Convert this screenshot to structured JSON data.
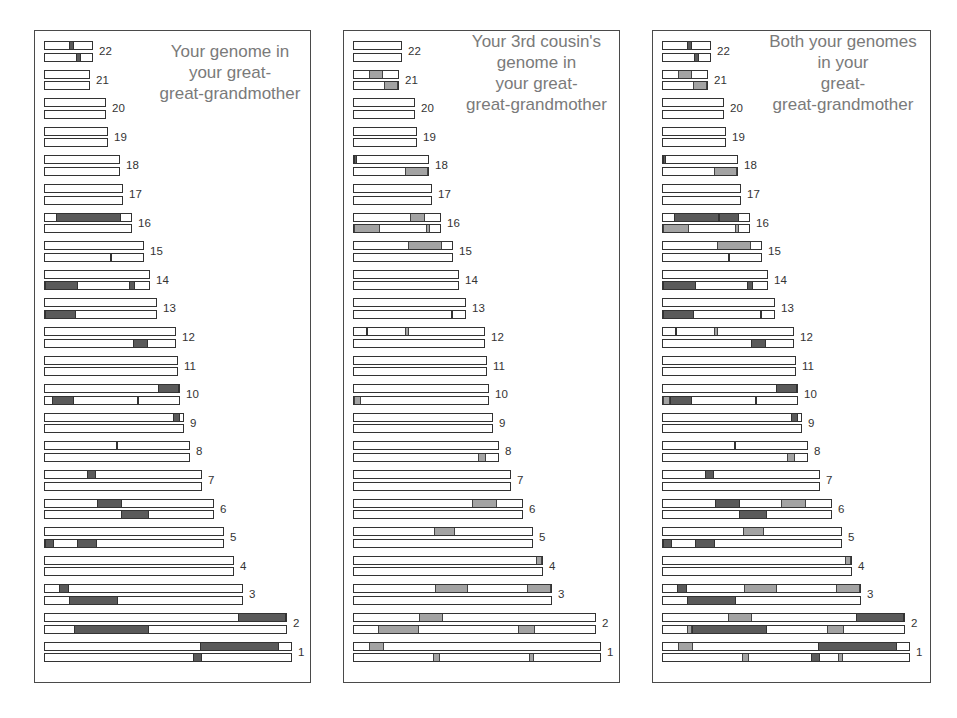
{
  "colors": {
    "you_segment": "#5a5a5a",
    "cousin_segment": "#a3a3a3",
    "bar_fill": "#ffffff",
    "bar_border": "#333333",
    "title_text": "#7a7a7a"
  },
  "chromosome_lengths_px": {
    "22": 49,
    "21": 46,
    "20": 62,
    "19": 64,
    "18": 76,
    "17": 79,
    "16": 88,
    "15": 100,
    "14": 106,
    "13": 113,
    "12": 132,
    "11": 134,
    "10": 136,
    "9": 140,
    "8": 146,
    "7": 158,
    "6": 170,
    "5": 180,
    "4": 190,
    "3": 199,
    "2": 243,
    "1": 248
  },
  "panels": [
    {
      "id": "you",
      "title_lines": [
        "Your genome in",
        "your great-",
        "great-grandmother"
      ],
      "chromosomes": [
        {
          "label": "22",
          "top": [
            [
              0.52,
              0.62,
              "dark"
            ]
          ],
          "bottom": [
            [
              0.66,
              0.76,
              "dark"
            ]
          ]
        },
        {
          "label": "21",
          "top": [],
          "bottom": []
        },
        {
          "label": "20",
          "top": [],
          "bottom": []
        },
        {
          "label": "19",
          "top": [],
          "bottom": []
        },
        {
          "label": "18",
          "top": [],
          "bottom": []
        },
        {
          "label": "17",
          "top": [],
          "bottom": []
        },
        {
          "label": "16",
          "top": [
            [
              0.13,
              0.88,
              "dark"
            ]
          ],
          "bottom": []
        },
        {
          "label": "15",
          "top": [],
          "bottom": [
            [
              0.66,
              0.69,
              "tick"
            ]
          ]
        },
        {
          "label": "14",
          "top": [],
          "bottom": [
            [
              0.0,
              0.32,
              "dark"
            ],
            [
              0.81,
              0.87,
              "dark"
            ]
          ]
        },
        {
          "label": "13",
          "top": [],
          "bottom": [
            [
              0.0,
              0.28,
              "dark"
            ]
          ]
        },
        {
          "label": "12",
          "top": [],
          "bottom": [
            [
              0.68,
              0.79,
              "dark"
            ]
          ]
        },
        {
          "label": "11",
          "top": [],
          "bottom": []
        },
        {
          "label": "10",
          "top": [
            [
              0.84,
              1.0,
              "dark"
            ]
          ],
          "bottom": [
            [
              0.05,
              0.22,
              "dark"
            ],
            [
              0.69,
              0.71,
              "tick"
            ]
          ]
        },
        {
          "label": "9",
          "top": [
            [
              0.93,
              0.98,
              "dark"
            ]
          ],
          "bottom": []
        },
        {
          "label": "8",
          "top": [
            [
              0.49,
              0.51,
              "tick"
            ]
          ],
          "bottom": []
        },
        {
          "label": "7",
          "top": [
            [
              0.27,
              0.33,
              "dark"
            ]
          ],
          "bottom": []
        },
        {
          "label": "6",
          "top": [
            [
              0.31,
              0.46,
              "dark"
            ]
          ],
          "bottom": [
            [
              0.45,
              0.62,
              "dark"
            ]
          ]
        },
        {
          "label": "5",
          "top": [],
          "bottom": [
            [
              0.0,
              0.05,
              "dark"
            ],
            [
              0.18,
              0.29,
              "dark"
            ]
          ]
        },
        {
          "label": "4",
          "top": [],
          "bottom": []
        },
        {
          "label": "3",
          "top": [
            [
              0.07,
              0.12,
              "dark"
            ]
          ],
          "bottom": [
            [
              0.12,
              0.37,
              "dark"
            ]
          ]
        },
        {
          "label": "2",
          "top": [
            [
              0.8,
              1.0,
              "dark"
            ]
          ],
          "bottom": [
            [
              0.12,
              0.43,
              "dark"
            ]
          ]
        },
        {
          "label": "1",
          "top": [
            [
              0.63,
              0.95,
              "dark"
            ]
          ],
          "bottom": [
            [
              0.6,
              0.64,
              "dark"
            ]
          ]
        }
      ]
    },
    {
      "id": "cousin",
      "title_lines": [
        "Your 3rd cousin's",
        "genome in",
        "your great-",
        "great-grandmother"
      ],
      "chromosomes": [
        {
          "label": "22",
          "top": [],
          "bottom": []
        },
        {
          "label": "21",
          "top": [
            [
              0.33,
              0.66,
              "light"
            ]
          ],
          "bottom": [
            [
              0.68,
              1.0,
              "light"
            ]
          ]
        },
        {
          "label": "20",
          "top": [],
          "bottom": []
        },
        {
          "label": "19",
          "top": [],
          "bottom": []
        },
        {
          "label": "18",
          "top": [
            [
              0.0,
              0.04,
              "dark"
            ]
          ],
          "bottom": [
            [
              0.69,
              1.0,
              "light"
            ]
          ]
        },
        {
          "label": "17",
          "top": [],
          "bottom": []
        },
        {
          "label": "16",
          "top": [
            [
              0.65,
              0.83,
              "light"
            ]
          ],
          "bottom": [
            [
              0.0,
              0.3,
              "light"
            ],
            [
              0.84,
              0.88,
              "light"
            ]
          ]
        },
        {
          "label": "15",
          "top": [
            [
              0.55,
              0.9,
              "light"
            ]
          ],
          "bottom": []
        },
        {
          "label": "14",
          "top": [],
          "bottom": []
        },
        {
          "label": "13",
          "top": [],
          "bottom": [
            [
              0.87,
              0.89,
              "tick"
            ]
          ]
        },
        {
          "label": "12",
          "top": [
            [
              0.09,
              0.11,
              "tick"
            ],
            [
              0.39,
              0.42,
              "light"
            ]
          ],
          "bottom": []
        },
        {
          "label": "11",
          "top": [],
          "bottom": []
        },
        {
          "label": "10",
          "top": [],
          "bottom": [
            [
              0.0,
              0.05,
              "light"
            ]
          ]
        },
        {
          "label": "9",
          "top": [],
          "bottom": []
        },
        {
          "label": "8",
          "top": [],
          "bottom": [
            [
              0.86,
              0.92,
              "light"
            ]
          ]
        },
        {
          "label": "7",
          "top": [],
          "bottom": []
        },
        {
          "label": "6",
          "top": [
            [
              0.7,
              0.85,
              "light"
            ]
          ],
          "bottom": []
        },
        {
          "label": "5",
          "top": [
            [
              0.45,
              0.57,
              "light"
            ]
          ],
          "bottom": []
        },
        {
          "label": "4",
          "top": [
            [
              0.97,
              1.0,
              "light"
            ]
          ],
          "bottom": []
        },
        {
          "label": "3",
          "top": [
            [
              0.41,
              0.58,
              "light"
            ],
            [
              0.88,
              1.0,
              "light"
            ]
          ],
          "bottom": []
        },
        {
          "label": "2",
          "top": [
            [
              0.27,
              0.37,
              "light"
            ]
          ],
          "bottom": [
            [
              0.1,
              0.27,
              "light"
            ],
            [
              0.68,
              0.75,
              "light"
            ]
          ]
        },
        {
          "label": "1",
          "top": [
            [
              0.06,
              0.12,
              "light"
            ]
          ],
          "bottom": [
            [
              0.32,
              0.35,
              "light"
            ],
            [
              0.71,
              0.73,
              "light"
            ]
          ]
        }
      ]
    },
    {
      "id": "both",
      "title_lines": [
        "Both your genomes",
        "in your",
        "great-",
        "great-grandmother"
      ],
      "chromosomes": [
        {
          "label": "22",
          "top": [
            [
              0.52,
              0.62,
              "dark"
            ]
          ],
          "bottom": [
            [
              0.66,
              0.76,
              "dark"
            ]
          ]
        },
        {
          "label": "21",
          "top": [
            [
              0.33,
              0.66,
              "light"
            ]
          ],
          "bottom": [
            [
              0.68,
              1.0,
              "light"
            ]
          ]
        },
        {
          "label": "20",
          "top": [],
          "bottom": []
        },
        {
          "label": "19",
          "top": [],
          "bottom": []
        },
        {
          "label": "18",
          "top": [
            [
              0.0,
              0.04,
              "dark"
            ]
          ],
          "bottom": [
            [
              0.69,
              1.0,
              "light"
            ]
          ]
        },
        {
          "label": "17",
          "top": [],
          "bottom": []
        },
        {
          "label": "16",
          "top": [
            [
              0.13,
              0.65,
              "dark"
            ],
            [
              0.65,
              0.88,
              "dark"
            ]
          ],
          "bottom": [
            [
              0.0,
              0.3,
              "light"
            ],
            [
              0.84,
              0.88,
              "light"
            ]
          ]
        },
        {
          "label": "15",
          "top": [
            [
              0.55,
              0.9,
              "light"
            ]
          ],
          "bottom": [
            [
              0.66,
              0.69,
              "tick"
            ]
          ]
        },
        {
          "label": "14",
          "top": [],
          "bottom": [
            [
              0.0,
              0.32,
              "dark"
            ],
            [
              0.81,
              0.87,
              "dark"
            ]
          ]
        },
        {
          "label": "13",
          "top": [],
          "bottom": [
            [
              0.0,
              0.28,
              "dark"
            ],
            [
              0.87,
              0.89,
              "tick"
            ]
          ]
        },
        {
          "label": "12",
          "top": [
            [
              0.09,
              0.11,
              "tick"
            ],
            [
              0.39,
              0.42,
              "light"
            ]
          ],
          "bottom": [
            [
              0.68,
              0.79,
              "dark"
            ]
          ]
        },
        {
          "label": "11",
          "top": [],
          "bottom": []
        },
        {
          "label": "10",
          "top": [
            [
              0.84,
              1.0,
              "dark"
            ]
          ],
          "bottom": [
            [
              0.0,
              0.05,
              "light"
            ],
            [
              0.05,
              0.22,
              "dark"
            ],
            [
              0.69,
              0.71,
              "tick"
            ]
          ]
        },
        {
          "label": "9",
          "top": [
            [
              0.93,
              0.98,
              "dark"
            ]
          ],
          "bottom": []
        },
        {
          "label": "8",
          "top": [
            [
              0.49,
              0.51,
              "tick"
            ]
          ],
          "bottom": [
            [
              0.86,
              0.92,
              "light"
            ]
          ]
        },
        {
          "label": "7",
          "top": [
            [
              0.27,
              0.33,
              "dark"
            ]
          ],
          "bottom": []
        },
        {
          "label": "6",
          "top": [
            [
              0.31,
              0.46,
              "dark"
            ],
            [
              0.7,
              0.85,
              "light"
            ]
          ],
          "bottom": [
            [
              0.45,
              0.62,
              "dark"
            ]
          ]
        },
        {
          "label": "5",
          "top": [
            [
              0.45,
              0.57,
              "light"
            ]
          ],
          "bottom": [
            [
              0.0,
              0.05,
              "dark"
            ],
            [
              0.18,
              0.29,
              "dark"
            ]
          ]
        },
        {
          "label": "4",
          "top": [
            [
              0.97,
              1.0,
              "light"
            ]
          ],
          "bottom": []
        },
        {
          "label": "3",
          "top": [
            [
              0.07,
              0.12,
              "dark"
            ],
            [
              0.41,
              0.58,
              "light"
            ],
            [
              0.88,
              1.0,
              "light"
            ]
          ],
          "bottom": [
            [
              0.12,
              0.37,
              "dark"
            ]
          ]
        },
        {
          "label": "2",
          "top": [
            [
              0.27,
              0.37,
              "light"
            ],
            [
              0.8,
              1.0,
              "dark"
            ]
          ],
          "bottom": [
            [
              0.1,
              0.12,
              "light"
            ],
            [
              0.12,
              0.43,
              "dark"
            ],
            [
              0.68,
              0.75,
              "light"
            ]
          ]
        },
        {
          "label": "1",
          "top": [
            [
              0.06,
              0.12,
              "light"
            ],
            [
              0.63,
              0.95,
              "dark"
            ]
          ],
          "bottom": [
            [
              0.32,
              0.35,
              "light"
            ],
            [
              0.6,
              0.64,
              "dark"
            ],
            [
              0.71,
              0.73,
              "light"
            ]
          ]
        }
      ]
    }
  ]
}
